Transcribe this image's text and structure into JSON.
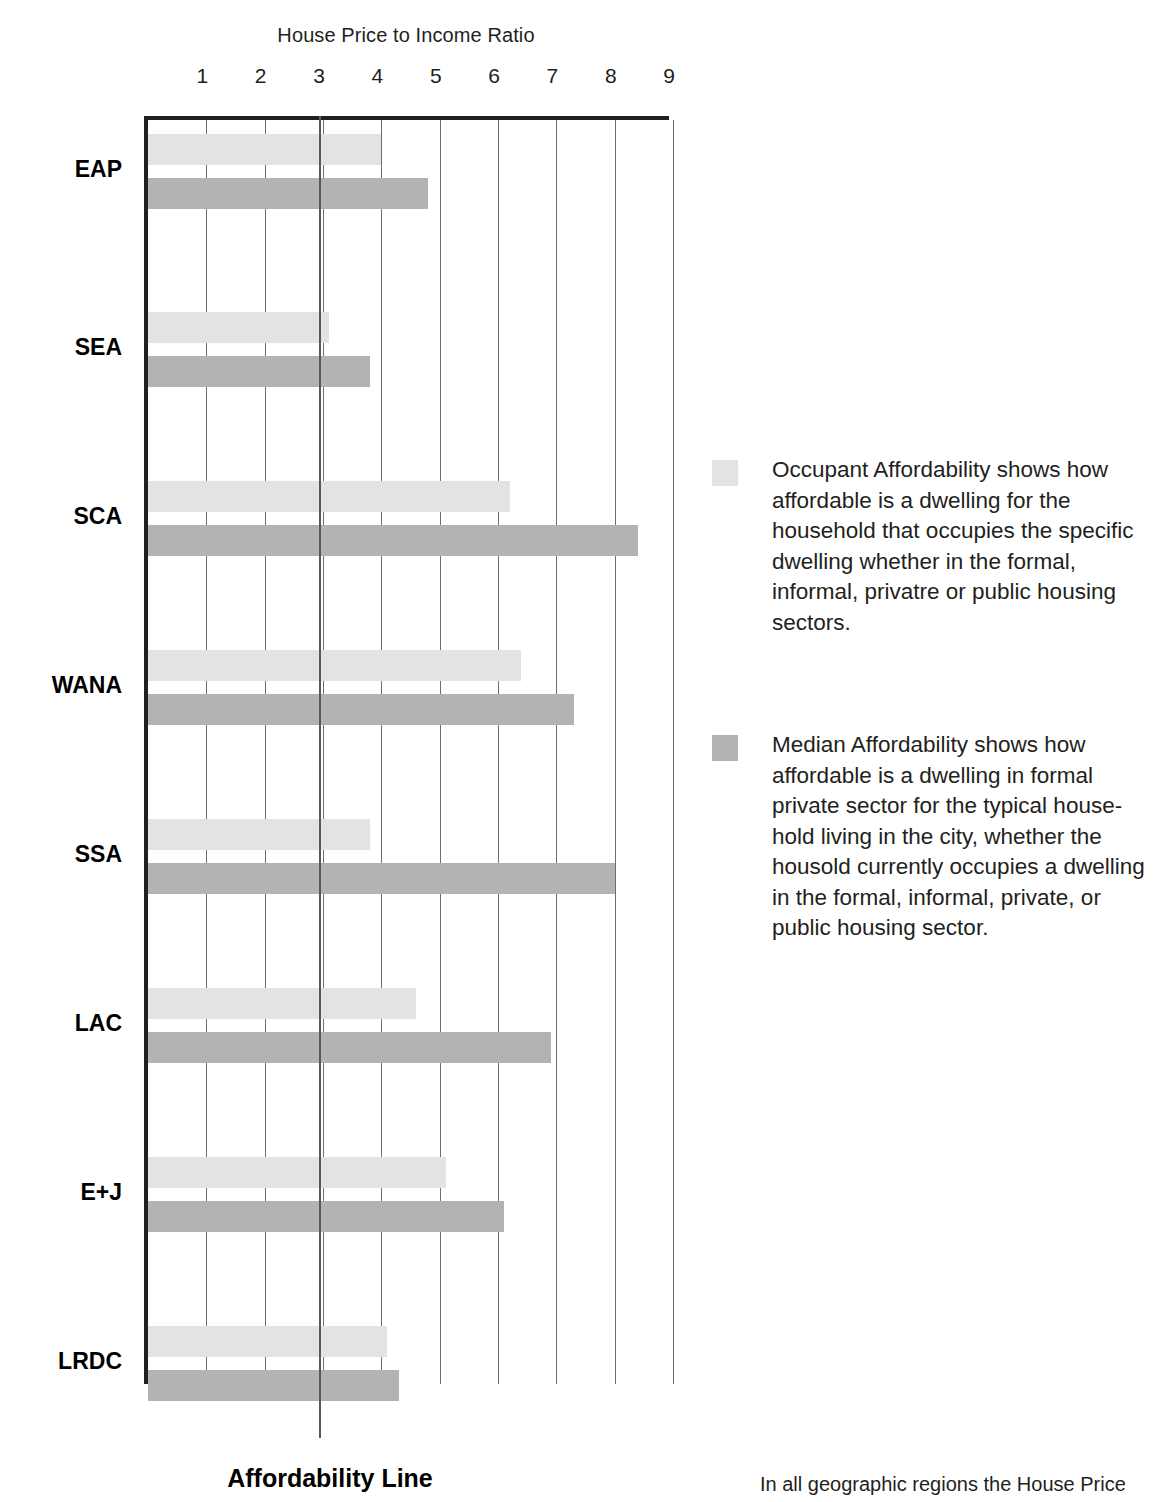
{
  "chart_data": {
    "type": "bar",
    "orientation": "horizontal",
    "title": "House Price to Income Ratio",
    "xlabel": "House Price to Income Ratio",
    "ylabel": "",
    "xlim": [
      0,
      9
    ],
    "xticks": [
      1,
      2,
      3,
      4,
      5,
      6,
      7,
      8,
      9
    ],
    "grid": true,
    "legend_position": "right",
    "categories": [
      "EAP",
      "SEA",
      "SCA",
      "WANA",
      "SSA",
      "LAC",
      "E+J",
      "LRDC"
    ],
    "series": [
      {
        "name": "Occupant Affordability",
        "color": "#e3e3e3",
        "values": [
          4.0,
          3.1,
          6.2,
          6.4,
          3.8,
          4.6,
          5.1,
          4.1
        ]
      },
      {
        "name": "Median Affordability",
        "color": "#b3b3b3",
        "values": [
          4.8,
          3.8,
          8.4,
          7.3,
          8.0,
          6.9,
          6.1,
          4.3
        ]
      }
    ],
    "annotations": [
      {
        "name": "affordability-line",
        "label": "Affordability Line",
        "x": 3.0,
        "color": "#58595b"
      }
    ]
  },
  "axis": {
    "title": "House Price to Income Ratio",
    "ticks": [
      "1",
      "2",
      "3",
      "4",
      "5",
      "6",
      "7",
      "8",
      "9"
    ]
  },
  "categories": [
    {
      "label": "EAP"
    },
    {
      "label": "SEA"
    },
    {
      "label": "SCA"
    },
    {
      "label": "WANA"
    },
    {
      "label": "SSA"
    },
    {
      "label": "LAC"
    },
    {
      "label": "E+J"
    },
    {
      "label": "LRDC"
    }
  ],
  "annotations": {
    "affordability_line_label": "Affordability Line"
  },
  "legend": {
    "entries": [
      {
        "swatch": "occupant",
        "color": "#e3e3e3",
        "text": "Occupant Affordability shows how affordable is a dwelling for the household that occupies the specific dwelling whether in the formal, informal, privatre or public housing sectors."
      },
      {
        "swatch": "median",
        "color": "#b3b3b3",
        "text": "Median Affordability shows how affordable is a dwelling in formal private sector for the typical house-hold living in the city, whether the housold currently occupies a dwelling in the formal, informal, private, or public housing sector."
      }
    ]
  },
  "body": {
    "paragraph": "In all geographic regions the House Price"
  }
}
